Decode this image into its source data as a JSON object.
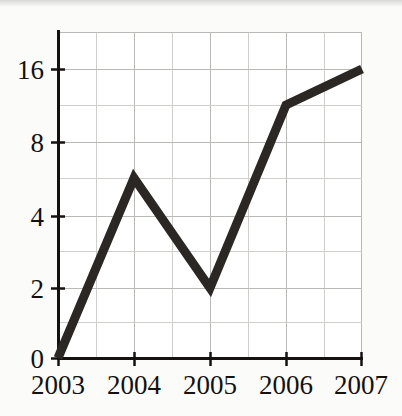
{
  "chart_data": {
    "type": "line",
    "title": "",
    "subtitle": "",
    "xlabel": "",
    "ylabel": "",
    "categories": [
      "2003",
      "2004",
      "2005",
      "2006",
      "2007"
    ],
    "x": [
      2003,
      2004,
      2005,
      2006,
      2007
    ],
    "values": [
      0,
      6,
      2,
      12,
      16
    ],
    "series": [
      {
        "name": "",
        "values": [
          0,
          6,
          2,
          12,
          16
        ]
      }
    ],
    "x_tick_labels": [
      "2003",
      "2004",
      "2005",
      "2006",
      "2007"
    ],
    "y_tick_labels": [
      "0",
      "2",
      "4",
      "8",
      "16"
    ],
    "y_tick_values": [
      0,
      2,
      4,
      8,
      16
    ],
    "ylim": [
      0,
      18
    ],
    "xlim": [
      2003,
      2007
    ],
    "y_scale": "doubling-steps",
    "grid": true,
    "grid_minor_x": true,
    "grid_minor_y": true,
    "legend": "none",
    "annotations": [],
    "colors": {
      "line": "#2b2725",
      "grid": "#b9b9b6",
      "grid_minor": "#cfcfcc",
      "axis": "#15110f",
      "background": "#fbfbfa",
      "plot_background": "#ffffff",
      "text": "#15110f"
    },
    "line_width_px": 9,
    "points": [
      {
        "x_label": "2003",
        "y_value": 0
      },
      {
        "x_label": "2004",
        "y_value": 6
      },
      {
        "x_label": "2005",
        "y_value": 2
      },
      {
        "x_label": "2006",
        "y_value": 12
      },
      {
        "x_label": "2007",
        "y_value": 16
      }
    ]
  },
  "geometry": {
    "plot_left": 58,
    "plot_right": 362,
    "plot_top": 32,
    "plot_bottom": 358,
    "y_pixel_for_value": {
      "0": 358,
      "2": 288,
      "4": 216,
      "6": 178,
      "8": 142,
      "12": 105,
      "16": 69,
      "top": 32
    },
    "x_pixel_for_year": {
      "2003": 58,
      "2004": 134,
      "2005": 210,
      "2006": 286,
      "2007": 362
    },
    "y_minor_pixels": [
      322,
      251,
      178,
      105
    ],
    "x_minor_pixels": [
      96,
      172,
      248,
      324
    ]
  },
  "labels": {
    "y_0": "0",
    "y_2": "2",
    "y_4": "4",
    "y_8": "8",
    "y_16": "16",
    "x_2003": "2003",
    "x_2004": "2004",
    "x_2005": "2005",
    "x_2006": "2006",
    "x_2007": "2007"
  }
}
